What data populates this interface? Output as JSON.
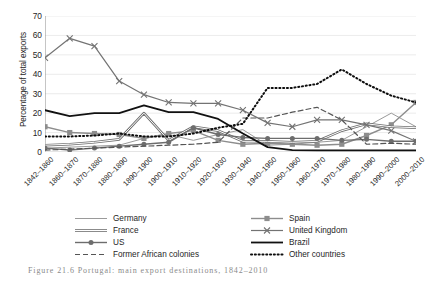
{
  "figure": {
    "caption": "Figure 21.6  Portugal: main export destinations, 1842–2010"
  },
  "chart_data": {
    "type": "line",
    "title": "",
    "xlabel": "",
    "ylabel": "Percentage of total exports",
    "ylim": [
      0,
      70
    ],
    "yticks": [
      0,
      10,
      20,
      30,
      40,
      50,
      60,
      70
    ],
    "grid": "horizontal",
    "legend_position": "bottom",
    "categories": [
      "1842–1860",
      "1860–1870",
      "1870–1880",
      "1880–1890",
      "1890–1900",
      "1900–1910",
      "1910–1920",
      "1920–1930",
      "1930–1940",
      "1940–1950",
      "1950–1960",
      "1960–1970",
      "1970–1980",
      "1980–1990",
      "1990–2000",
      "2000–2010"
    ],
    "series": [
      {
        "name": "Germany",
        "color": "#9a9a9a",
        "marker": "none",
        "dash": "solid",
        "width": 1,
        "values": [
          2.0,
          2.5,
          3.0,
          3.5,
          7.0,
          9.0,
          6.0,
          9.0,
          11.5,
          3.5,
          4.0,
          5.0,
          6.0,
          13.0,
          20.0,
          13.0
        ]
      },
      {
        "name": "Spain",
        "color": "#8d8d8d",
        "marker": "square",
        "dash": "solid",
        "width": 1.4,
        "values": [
          13.0,
          10.0,
          9.5,
          9.0,
          7.0,
          9.5,
          11.0,
          6.0,
          4.0,
          4.5,
          4.0,
          3.5,
          4.0,
          8.5,
          14.0,
          25.5
        ]
      },
      {
        "name": "France",
        "color": "#6f6f6f",
        "marker": "none",
        "dash": "double",
        "width": 2.6,
        "values": [
          3.5,
          4.0,
          5.0,
          6.5,
          20.0,
          6.0,
          13.0,
          11.0,
          5.5,
          5.5,
          5.0,
          5.5,
          11.0,
          14.5,
          13.0,
          12.5
        ]
      },
      {
        "name": "United Kingdom",
        "color": "#737373",
        "marker": "x",
        "dash": "solid",
        "width": 1.2,
        "values": [
          48.5,
          58.5,
          54.5,
          36.5,
          29.5,
          25.5,
          25.0,
          25.0,
          21.5,
          15.0,
          13.0,
          16.5,
          16.5,
          14.0,
          11.0,
          5.5
        ]
      },
      {
        "name": "US",
        "color": "#6d6d6d",
        "marker": "circle",
        "dash": "solid",
        "width": 1.4,
        "values": [
          2.0,
          1.0,
          2.0,
          3.0,
          4.0,
          5.0,
          12.5,
          9.0,
          7.5,
          7.0,
          7.0,
          7.0,
          6.0,
          6.5,
          5.5,
          5.5
        ]
      },
      {
        "name": "Brazil",
        "color": "#111111",
        "marker": "none",
        "dash": "solid",
        "width": 1.8,
        "values": [
          21.5,
          18.5,
          20.0,
          20.0,
          24.0,
          20.5,
          20.5,
          17.0,
          9.5,
          2.5,
          1.0,
          0.8,
          0.8,
          0.8,
          0.8,
          0.8
        ]
      },
      {
        "name": "Former African colonies",
        "color": "#555555",
        "marker": "none",
        "dash": "dashed",
        "width": 1.2,
        "values": [
          1.0,
          1.5,
          2.0,
          2.5,
          3.0,
          3.5,
          4.0,
          5.0,
          17.5,
          17.5,
          20.5,
          23.0,
          16.5,
          4.0,
          4.5,
          4.0
        ]
      },
      {
        "name": "Other countries",
        "color": "#0d0d0d",
        "marker": "none",
        "dash": "dotted",
        "width": 2.0,
        "values": [
          8.0,
          8.0,
          8.5,
          9.5,
          8.0,
          8.0,
          9.5,
          12.5,
          14.5,
          33.0,
          33.0,
          35.0,
          42.5,
          35.0,
          29.0,
          25.5
        ]
      }
    ]
  },
  "legend": {
    "left_column": [
      {
        "label": "Germany"
      },
      {
        "label": "France"
      },
      {
        "label": "US"
      },
      {
        "label": "Former African colonies"
      }
    ],
    "right_column": [
      {
        "label": "Spain"
      },
      {
        "label": "United Kingdom"
      },
      {
        "label": "Brazil"
      },
      {
        "label": "Other countries"
      }
    ]
  }
}
